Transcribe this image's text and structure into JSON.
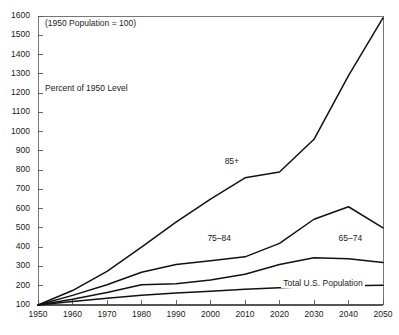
{
  "chart_data": {
    "type": "line",
    "title": "",
    "subtitle": "",
    "note": "(1950 Population = 100)",
    "ylabel_inline": "Percent of 1950 Level",
    "xlabel": "",
    "ylabel": "",
    "xlim": [
      1950,
      2050
    ],
    "ylim": [
      100,
      1600
    ],
    "grid": false,
    "legend_position": "inline-labels",
    "x": [
      1950,
      1960,
      1970,
      1980,
      1990,
      2000,
      2010,
      2020,
      2030,
      2040,
      2050
    ],
    "xtick_labels": [
      "1950",
      "1960",
      "1970",
      "1980",
      "1990",
      "2000",
      "2010",
      "2020",
      "2030",
      "2040",
      "2050"
    ],
    "ytick_labels": [
      "100",
      "200",
      "300",
      "400",
      "500",
      "600",
      "700",
      "800",
      "900",
      "1000",
      "1100",
      "1200",
      "1300",
      "1400",
      "1500",
      "1600"
    ],
    "ytick_values": [
      100,
      200,
      300,
      400,
      500,
      600,
      700,
      800,
      900,
      1000,
      1100,
      1200,
      1300,
      1400,
      1500,
      1600
    ],
    "series": [
      {
        "name": "85+",
        "label": "85+",
        "label_x": 2007,
        "label_y": 840,
        "values": [
          100,
          175,
          275,
          400,
          530,
          650,
          760,
          790,
          960,
          1290,
          1590
        ]
      },
      {
        "name": "75-84",
        "label": "75–84",
        "label_x": 2002,
        "label_y": 440,
        "values": [
          100,
          150,
          205,
          270,
          310,
          330,
          350,
          420,
          545,
          610,
          500
        ]
      },
      {
        "name": "65-74",
        "label": "65–74",
        "label_x": 2040,
        "label_y": 440,
        "values": [
          100,
          130,
          165,
          205,
          210,
          230,
          260,
          310,
          345,
          340,
          320
        ]
      },
      {
        "name": "Total U.S. Population",
        "label": "Total U.S. Population",
        "label_x": 2024,
        "label_y": 210,
        "values": [
          100,
          118,
          135,
          150,
          162,
          172,
          182,
          190,
          196,
          200,
          203
        ]
      }
    ]
  },
  "axes": {
    "note_text": "(1950 Population = 100)",
    "inline_axis_text": "Percent of 1950 Level"
  },
  "colors": {
    "line": "#111111",
    "frame": "#555555",
    "background": "#ffffff",
    "text": "#1a1a1a"
  }
}
